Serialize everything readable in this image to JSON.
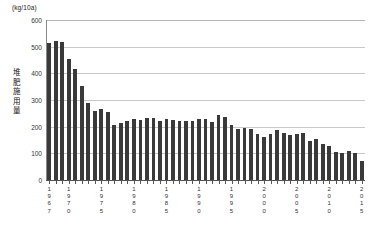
{
  "chart_data": {
    "type": "bar",
    "title": "",
    "subtitle": "",
    "unit_label": "(kg/10a)",
    "ylabel": "堆肥施用量",
    "xlabel": "",
    "ylim": [
      0,
      600
    ],
    "ytick_step": 100,
    "yticks": [
      "0",
      "100",
      "200",
      "300",
      "400",
      "500",
      "600"
    ],
    "grid": true,
    "legend": "none",
    "bar_color": "#3a3a3a",
    "categories": [
      "1967",
      "1968",
      "1969",
      "1970",
      "1971",
      "1972",
      "1973",
      "1974",
      "1975",
      "1976",
      "1977",
      "1978",
      "1979",
      "1980",
      "1981",
      "1982",
      "1983",
      "1984",
      "1985",
      "1986",
      "1987",
      "1988",
      "1989",
      "1990",
      "1991",
      "1992",
      "1993",
      "1994",
      "1995",
      "1996",
      "1997",
      "1998",
      "1999",
      "2000",
      "2001",
      "2002",
      "2003",
      "2004",
      "2005",
      "2006",
      "2007",
      "2008",
      "2009",
      "2010",
      "2011",
      "2012",
      "2013",
      "2014",
      "2015"
    ],
    "values": [
      512,
      520,
      516,
      455,
      418,
      352,
      290,
      258,
      268,
      256,
      207,
      212,
      222,
      230,
      224,
      232,
      231,
      222,
      230,
      226,
      220,
      222,
      220,
      230,
      228,
      216,
      243,
      237,
      208,
      190,
      196,
      192,
      172,
      160,
      174,
      188,
      176,
      170,
      172,
      176,
      148,
      152,
      134,
      126,
      106,
      102,
      110,
      100,
      70
    ],
    "xtick_labels": [
      {
        "year": "1967",
        "index": 0
      },
      {
        "year": "1970",
        "index": 3
      },
      {
        "year": "1975",
        "index": 8
      },
      {
        "year": "1980",
        "index": 13
      },
      {
        "year": "1985",
        "index": 18
      },
      {
        "year": "1990",
        "index": 23
      },
      {
        "year": "1995",
        "index": 28
      },
      {
        "year": "2000",
        "index": 33
      },
      {
        "year": "2005",
        "index": 38
      },
      {
        "year": "2010",
        "index": 43
      },
      {
        "year": "2015",
        "index": 48
      }
    ]
  }
}
